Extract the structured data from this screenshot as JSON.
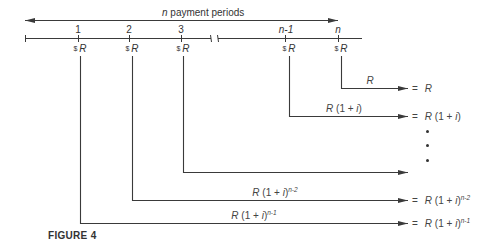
{
  "figure": {
    "caption": "FIGURE 4",
    "span_label_n": "n",
    "span_label_rest": " payment periods",
    "colors": {
      "line": "#3a3a3a",
      "text": "#333333",
      "background": "#ffffff"
    }
  },
  "timeline": {
    "ticks": [
      {
        "label": "1",
        "payment": "R"
      },
      {
        "label": "2",
        "payment": "R"
      },
      {
        "label": "3",
        "payment": "R"
      },
      {
        "label": "n-1",
        "payment": "R"
      },
      {
        "label": "n",
        "payment": "R"
      }
    ],
    "currency_symbol": "$",
    "has_break_between": [
      "3",
      "n-1"
    ]
  },
  "flows": [
    {
      "from": "n",
      "arrow_label": "R",
      "result": "R",
      "exp": ""
    },
    {
      "from": "n-1",
      "arrow_label": "R(1 + i)",
      "result": "R(1 + i)",
      "exp": ""
    },
    {
      "from": "3",
      "arrow_label": "",
      "result": "",
      "exp": ""
    },
    {
      "from": "2",
      "arrow_label_base": "R(1 + i)",
      "result_base": "R(1 + i)",
      "exp": "n-2"
    },
    {
      "from": "1",
      "arrow_label_base": "R(1 + i)",
      "result_base": "R(1 + i)",
      "exp": "n-1"
    }
  ],
  "ellipsis": "vertical dots",
  "equals_sign": "="
}
